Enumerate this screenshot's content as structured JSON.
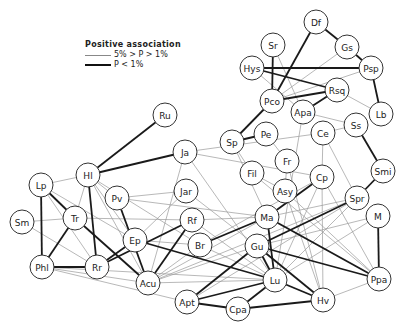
{
  "legend": {
    "title": "Positive association",
    "thin_label": "5% > P > 1%",
    "thick_label": "P < 1%"
  },
  "style": {
    "thin_color": "#9a9a9a",
    "thick_color": "#1a1a1a",
    "node_stroke": "#333333",
    "node_radius": 12
  },
  "nodes": [
    {
      "id": "Df",
      "x": 316,
      "y": 22
    },
    {
      "id": "Gs",
      "x": 347,
      "y": 47
    },
    {
      "id": "Sr",
      "x": 273,
      "y": 45
    },
    {
      "id": "Hys",
      "x": 252,
      "y": 68
    },
    {
      "id": "Psp",
      "x": 371,
      "y": 68
    },
    {
      "id": "Rsq",
      "x": 337,
      "y": 90
    },
    {
      "id": "Pco",
      "x": 272,
      "y": 101
    },
    {
      "id": "Apa",
      "x": 303,
      "y": 112
    },
    {
      "id": "Lb",
      "x": 381,
      "y": 114
    },
    {
      "id": "Ru",
      "x": 165,
      "y": 115
    },
    {
      "id": "Ss",
      "x": 356,
      "y": 125
    },
    {
      "id": "Ce",
      "x": 323,
      "y": 133
    },
    {
      "id": "Pe",
      "x": 266,
      "y": 134
    },
    {
      "id": "Sp",
      "x": 232,
      "y": 142
    },
    {
      "id": "Ja",
      "x": 185,
      "y": 152
    },
    {
      "id": "Fr",
      "x": 287,
      "y": 161
    },
    {
      "id": "Smi",
      "x": 383,
      "y": 171
    },
    {
      "id": "Fil",
      "x": 252,
      "y": 173
    },
    {
      "id": "Hl",
      "x": 88,
      "y": 175
    },
    {
      "id": "Cp",
      "x": 322,
      "y": 177
    },
    {
      "id": "Lp",
      "x": 41,
      "y": 185
    },
    {
      "id": "Jar",
      "x": 186,
      "y": 191
    },
    {
      "id": "Asy",
      "x": 285,
      "y": 191
    },
    {
      "id": "Pv",
      "x": 117,
      "y": 198
    },
    {
      "id": "Spr",
      "x": 357,
      "y": 198
    },
    {
      "id": "M",
      "x": 378,
      "y": 216
    },
    {
      "id": "Ma",
      "x": 267,
      "y": 217
    },
    {
      "id": "Tr",
      "x": 75,
      "y": 218
    },
    {
      "id": "Rf",
      "x": 192,
      "y": 220
    },
    {
      "id": "Sm",
      "x": 22,
      "y": 222
    },
    {
      "id": "Ep",
      "x": 135,
      "y": 240
    },
    {
      "id": "Br",
      "x": 200,
      "y": 245
    },
    {
      "id": "Gu",
      "x": 257,
      "y": 246
    },
    {
      "id": "Phl",
      "x": 42,
      "y": 267
    },
    {
      "id": "Rr",
      "x": 97,
      "y": 267
    },
    {
      "id": "Ppa",
      "x": 379,
      "y": 279
    },
    {
      "id": "Lu",
      "x": 275,
      "y": 280
    },
    {
      "id": "Acu",
      "x": 148,
      "y": 283
    },
    {
      "id": "Hv",
      "x": 323,
      "y": 300
    },
    {
      "id": "Apt",
      "x": 187,
      "y": 302
    },
    {
      "id": "Cpa",
      "x": 238,
      "y": 309
    }
  ],
  "edges_thick": [
    [
      "Df",
      "Gs"
    ],
    [
      "Gs",
      "Psp"
    ],
    [
      "Df",
      "Pco"
    ],
    [
      "Sr",
      "Pco"
    ],
    [
      "Hys",
      "Psp"
    ],
    [
      "Hys",
      "Rsq"
    ],
    [
      "Pco",
      "Rsq"
    ],
    [
      "Rsq",
      "Apa"
    ],
    [
      "Psp",
      "Lb"
    ],
    [
      "Pco",
      "Sp"
    ],
    [
      "Sp",
      "Pe"
    ],
    [
      "Ss",
      "Smi"
    ],
    [
      "Smi",
      "Spr"
    ],
    [
      "Hl",
      "Ru"
    ],
    [
      "Hl",
      "Ja"
    ],
    [
      "Hl",
      "Rr"
    ],
    [
      "Lp",
      "Tr"
    ],
    [
      "Lp",
      "Phl"
    ],
    [
      "Tr",
      "Phl"
    ],
    [
      "Phl",
      "Rr"
    ],
    [
      "Tr",
      "Acu"
    ],
    [
      "Pv",
      "Acu"
    ],
    [
      "Ep",
      "Rr"
    ],
    [
      "Rf",
      "Rr"
    ],
    [
      "Rf",
      "Acu"
    ],
    [
      "Ep",
      "Lu"
    ],
    [
      "Br",
      "Ma"
    ],
    [
      "Cp",
      "Ma"
    ],
    [
      "Spr",
      "Gu"
    ],
    [
      "Ma",
      "Lu"
    ],
    [
      "Ma",
      "Ppa"
    ],
    [
      "Gu",
      "Ppa"
    ],
    [
      "Gu",
      "Lu"
    ],
    [
      "Gu",
      "Hv"
    ],
    [
      "Gu",
      "Apt"
    ],
    [
      "Lu",
      "Hv"
    ],
    [
      "Lu",
      "Apt"
    ],
    [
      "Lu",
      "Cpa"
    ],
    [
      "Apt",
      "Cpa"
    ],
    [
      "Cpa",
      "Hv"
    ],
    [
      "M",
      "Ppa"
    ]
  ],
  "edges_thin": [
    [
      "Sr",
      "Apa"
    ],
    [
      "Hys",
      "Apa"
    ],
    [
      "Gs",
      "Pco"
    ],
    [
      "Psp",
      "Pco"
    ],
    [
      "Rsq",
      "Lb"
    ],
    [
      "Apa",
      "Ss"
    ],
    [
      "Apa",
      "Lu"
    ],
    [
      "Ss",
      "Ce"
    ],
    [
      "Ce",
      "Cp"
    ],
    [
      "Ce",
      "Spr"
    ],
    [
      "Ce",
      "Ja"
    ],
    [
      "Pe",
      "Fr"
    ],
    [
      "Fr",
      "Asy"
    ],
    [
      "Fil",
      "Asy"
    ],
    [
      "Lp",
      "Hl"
    ],
    [
      "Lp",
      "Rr"
    ],
    [
      "Sm",
      "Tr"
    ],
    [
      "Sm",
      "Rr"
    ],
    [
      "Hl",
      "Tr"
    ],
    [
      "Hl",
      "Ep"
    ],
    [
      "Hl",
      "Acu"
    ],
    [
      "Hl",
      "Br"
    ],
    [
      "Hl",
      "Pv"
    ],
    [
      "Lp",
      "Ep"
    ],
    [
      "Tr",
      "Rf"
    ],
    [
      "Pv",
      "Jar"
    ],
    [
      "Pv",
      "Ma"
    ],
    [
      "Ja",
      "Acu"
    ],
    [
      "Ja",
      "Lu"
    ],
    [
      "Ja",
      "Cp"
    ],
    [
      "Jar",
      "Gu"
    ],
    [
      "Jar",
      "Ep"
    ],
    [
      "Rf",
      "Ma"
    ],
    [
      "Rf",
      "Lu"
    ],
    [
      "Ep",
      "Br"
    ],
    [
      "Acu",
      "Br"
    ],
    [
      "Acu",
      "Ma"
    ],
    [
      "Acu",
      "Gu"
    ],
    [
      "Acu",
      "Lu"
    ],
    [
      "Acu",
      "Spr"
    ],
    [
      "Phl",
      "Apt"
    ],
    [
      "Phl",
      "Acu"
    ],
    [
      "Phl",
      "Lu"
    ],
    [
      "Br",
      "Lu"
    ],
    [
      "Br",
      "Cp"
    ],
    [
      "Sp",
      "Fil"
    ],
    [
      "Sp",
      "Ma"
    ],
    [
      "Cp",
      "Lu"
    ],
    [
      "Cp",
      "Hv"
    ],
    [
      "Cp",
      "Ppa"
    ],
    [
      "Asy",
      "Ppa"
    ],
    [
      "Asy",
      "Hv"
    ],
    [
      "Spr",
      "Lu"
    ],
    [
      "Spr",
      "Apt"
    ],
    [
      "M",
      "Gu"
    ],
    [
      "M",
      "Lu"
    ],
    [
      "Fil",
      "Ppa"
    ],
    [
      "Ppa",
      "Hv"
    ],
    [
      "Ma",
      "Spr"
    ],
    [
      "Fr",
      "Hv"
    ]
  ]
}
